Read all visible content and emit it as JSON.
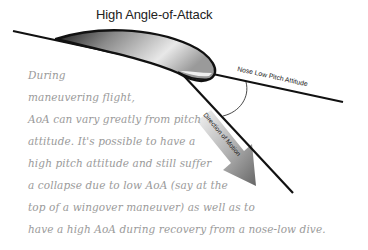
{
  "title": "High Angle-of-Attack",
  "labels": {
    "pitch_line": "Nose Low Pitch Attitude",
    "motion_arrow": "Direction of Motion"
  },
  "body_lines": [
    "During",
    "maneuvering flight,",
    "AoA can vary greatly from pitch",
    "attitude.  It's possible to have a",
    "high pitch attitude and still suffer",
    "a collapse due to low AoA (say at the",
    "top of a wingover maneuver) as well as to",
    "have a high AoA during recovery from a nose-low dive."
  ],
  "colors": {
    "line": "#111111",
    "text": "#9a9a9a",
    "arrow_dark": "#6e6e6e",
    "arrow_light": "#f2f2f2"
  }
}
